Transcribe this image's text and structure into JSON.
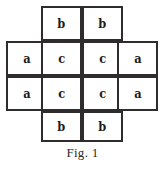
{
  "figure": {
    "caption": "Fig. 1",
    "shape": "cross",
    "grid": {
      "columns": 4,
      "rows": 4,
      "cell_width": 41,
      "cell_height": 35,
      "origin_x": 6,
      "origin_y": 6
    },
    "border_color": "#2e2c2c",
    "background_color": "#ffffff",
    "text_color": "#1d1b1b",
    "cells": [
      {
        "row": 0,
        "col": 1,
        "label": "b"
      },
      {
        "row": 0,
        "col": 2,
        "label": "b"
      },
      {
        "row": 1,
        "col": 0,
        "label": "a"
      },
      {
        "row": 1,
        "col": 1,
        "label": "c"
      },
      {
        "row": 1,
        "col": 2,
        "label": "c"
      },
      {
        "row": 1,
        "col": 3,
        "label": "a"
      },
      {
        "row": 2,
        "col": 0,
        "label": "a"
      },
      {
        "row": 2,
        "col": 1,
        "label": "c"
      },
      {
        "row": 2,
        "col": 2,
        "label": "c"
      },
      {
        "row": 2,
        "col": 3,
        "label": "a"
      },
      {
        "row": 3,
        "col": 1,
        "label": "b"
      },
      {
        "row": 3,
        "col": 2,
        "label": "b"
      }
    ]
  }
}
